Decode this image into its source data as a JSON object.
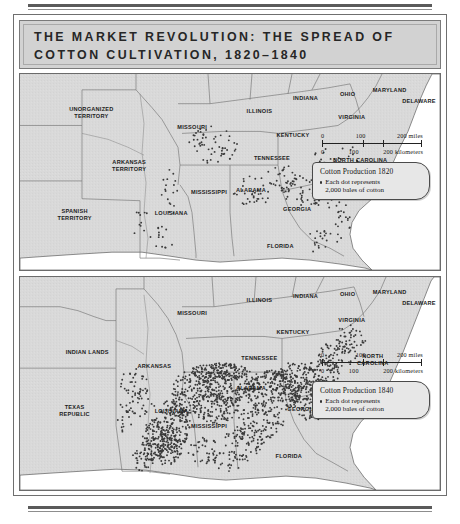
{
  "figure": {
    "title_lines": [
      "THE MARKET REVOLUTION: THE SPREAD OF",
      "COTTON CULTIVATION, 1820–1840"
    ]
  },
  "maps": [
    {
      "id": "map-1820",
      "year": "1820",
      "labels": [
        {
          "text": "UNORGANIZED\nTERRITORY",
          "x": 17,
          "y": 20
        },
        {
          "text": "MISSOURI",
          "x": 41,
          "y": 27
        },
        {
          "text": "ILLINOIS",
          "x": 57,
          "y": 19
        },
        {
          "text": "INDIANA",
          "x": 68,
          "y": 12
        },
        {
          "text": "OHIO",
          "x": 78,
          "y": 10
        },
        {
          "text": "MARYLAND",
          "x": 88,
          "y": 8
        },
        {
          "text": "DELAWARE",
          "x": 95,
          "y": 14
        },
        {
          "text": "VIRGINIA",
          "x": 79,
          "y": 22
        },
        {
          "text": "KENTUCKY",
          "x": 65,
          "y": 31
        },
        {
          "text": "TENNESSEE",
          "x": 60,
          "y": 43
        },
        {
          "text": "NORTH CAROLINA",
          "x": 81,
          "y": 44
        },
        {
          "text": "ARKANSAS\nTERRITORY",
          "x": 26,
          "y": 47
        },
        {
          "text": "MISSISSIPPI",
          "x": 45,
          "y": 60
        },
        {
          "text": "ALABAMA",
          "x": 55,
          "y": 59
        },
        {
          "text": "SOUTH\nCAROLINA",
          "x": 80,
          "y": 59
        },
        {
          "text": "GEORGIA",
          "x": 66,
          "y": 69
        },
        {
          "text": "LOUISIANA",
          "x": 36,
          "y": 71
        },
        {
          "text": "SPANISH\nTERRITORY",
          "x": 13,
          "y": 72
        },
        {
          "text": "FLORIDA",
          "x": 62,
          "y": 88
        }
      ],
      "scale": {
        "miles_ticks": [
          "0",
          "100",
          "200 miles"
        ],
        "km_ticks": [
          "0",
          "100",
          "200 kilometers"
        ]
      },
      "legend": {
        "title": "Cotton Production 1820",
        "line1": "Each dot represents",
        "line2": "2,000 bales of cotton"
      }
    },
    {
      "id": "map-1840",
      "year": "1840",
      "labels": [
        {
          "text": "MISSOURI",
          "x": 41,
          "y": 17
        },
        {
          "text": "ILLINOIS",
          "x": 57,
          "y": 11
        },
        {
          "text": "INDIANA",
          "x": 68,
          "y": 9
        },
        {
          "text": "OHIO",
          "x": 78,
          "y": 8
        },
        {
          "text": "MARYLAND",
          "x": 88,
          "y": 7
        },
        {
          "text": "DELAWARE",
          "x": 95,
          "y": 12
        },
        {
          "text": "VIRGINIA",
          "x": 79,
          "y": 20
        },
        {
          "text": "KENTUCKY",
          "x": 65,
          "y": 26
        },
        {
          "text": "INDIAN LANDS",
          "x": 16,
          "y": 35
        },
        {
          "text": "ARKANSAS",
          "x": 32,
          "y": 42
        },
        {
          "text": "TENNESSEE",
          "x": 57,
          "y": 38
        },
        {
          "text": "NORTH\nCAROLINA",
          "x": 84,
          "y": 39
        },
        {
          "text": "ALABAMA",
          "x": 55,
          "y": 52
        },
        {
          "text": "SOUTH CAROLINA",
          "x": 78,
          "y": 56
        },
        {
          "text": "GEORGIA",
          "x": 67,
          "y": 62
        },
        {
          "text": "LOUISIANA",
          "x": 36,
          "y": 63
        },
        {
          "text": "MISSISSIPPI",
          "x": 45,
          "y": 70
        },
        {
          "text": "TEXAS\nREPUBLIC",
          "x": 13,
          "y": 63
        },
        {
          "text": "FLORIDA",
          "x": 64,
          "y": 84
        }
      ],
      "scale": {
        "miles_ticks": [
          "0",
          "100",
          "200 miles"
        ],
        "km_ticks": [
          "0",
          "100",
          "200 kilometers"
        ]
      },
      "legend": {
        "title": "Cotton Production 1840",
        "line1": "Each dot represents",
        "line2": "2,000 bales of cotton"
      }
    }
  ]
}
